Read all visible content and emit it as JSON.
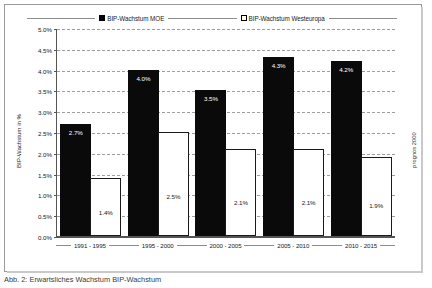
{
  "legend": {
    "items": [
      {
        "label": "BIP-Wachstum MOE",
        "swatch": "filled-square-icon",
        "color": "#000000"
      },
      {
        "label": "BIP-Wachstum Westeuropa",
        "swatch": "open-square-icon",
        "color": "#ffffff"
      }
    ]
  },
  "source_note": "prognos 2000",
  "caption": "Abb. 2:  Erwartsliches Wachstum BIP-Wachstum",
  "chart_data": {
    "type": "bar",
    "title": "",
    "subtitle": "",
    "xlabel": "",
    "ylabel": "BIP-Wachstum in %",
    "ylim": [
      0,
      5
    ],
    "yticks": [
      "0.0%",
      "0.5%",
      "1.0%",
      "1.5%",
      "2.0%",
      "2.5%",
      "3.0%",
      "3.5%",
      "4.0%",
      "4.5%",
      "5.0%"
    ],
    "ytick_values": [
      0,
      0.5,
      1.0,
      1.5,
      2.0,
      2.5,
      3.0,
      3.5,
      4.0,
      4.5,
      5.0
    ],
    "grid": true,
    "legend_position": "top",
    "categories": [
      "1991 - 1995",
      "1995 - 2000",
      "2000 - 2005",
      "2005 - 2010",
      "2010 - 2015"
    ],
    "series": [
      {
        "name": "BIP-Wachstum MOE",
        "color": "#000000",
        "values": [
          2.7,
          4.0,
          3.5,
          4.3,
          4.2
        ],
        "labels": [
          "2.7%",
          "4.0%",
          "3.5%",
          "4.3%",
          "4.2%"
        ]
      },
      {
        "name": "BIP-Wachstum Westeuropa",
        "color": "#ffffff",
        "values": [
          1.4,
          2.5,
          2.1,
          2.1,
          1.9
        ],
        "labels": [
          "1.4%",
          "2.5%",
          "2.1%",
          "2.1%",
          "1.9%"
        ]
      }
    ]
  }
}
